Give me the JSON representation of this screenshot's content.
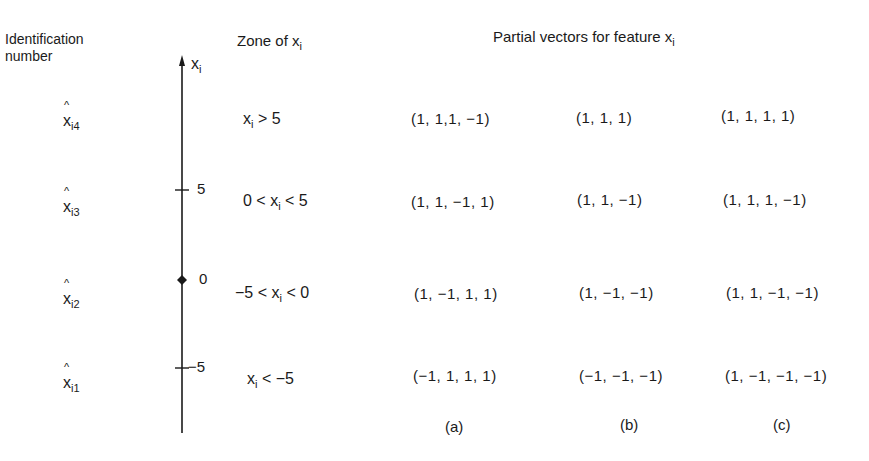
{
  "headers": {
    "identification": [
      "Identification",
      "number"
    ],
    "zone": {
      "text": "Zone of x",
      "sub": "i"
    },
    "partial": {
      "text": "Partial vectors for feature x",
      "sub": "i"
    }
  },
  "axis": {
    "label": {
      "text": "x",
      "sub": "i"
    },
    "ticks": [
      {
        "value": "5",
        "y": 190
      },
      {
        "value": "0",
        "y": 280
      },
      {
        "value": "−5",
        "y": 368
      }
    ]
  },
  "rows": [
    {
      "id": {
        "base": "x",
        "sub": "i4",
        "hat": "^"
      },
      "zone": {
        "pre": "",
        "var": "x",
        "sub": "i",
        "post": " > 5"
      },
      "vectors": {
        "a": "(1, 1,1, −1)",
        "b": "(1, 1, 1)",
        "c": "(1, 1, 1, 1)"
      }
    },
    {
      "id": {
        "base": "x",
        "sub": "i3",
        "hat": "^"
      },
      "zone": {
        "pre": "0 < ",
        "var": "x",
        "sub": "i",
        "post": " < 5"
      },
      "vectors": {
        "a": "(1, 1, −1, 1)",
        "b": "(1, 1, −1)",
        "c": "(1, 1, 1, −1)"
      }
    },
    {
      "id": {
        "base": "x",
        "sub": "i2",
        "hat": "^"
      },
      "zone": {
        "pre": "−5 < ",
        "var": "x",
        "sub": "i",
        "post": " < 0"
      },
      "vectors": {
        "a": "(1, −1, 1, 1)",
        "b": "(1, −1, −1)",
        "c": "(1, 1, −1, −1)"
      }
    },
    {
      "id": {
        "base": "x",
        "sub": "i1",
        "hat": "^"
      },
      "zone": {
        "pre": "",
        "var": "x",
        "sub": "i",
        "post": " < −5"
      },
      "vectors": {
        "a": "(−1, 1, 1, 1)",
        "b": "(−1, −1, −1)",
        "c": "(1, −1, −1, −1)"
      }
    }
  ],
  "captions": {
    "a": "(a)",
    "b": "(b)",
    "c": "(c)"
  }
}
